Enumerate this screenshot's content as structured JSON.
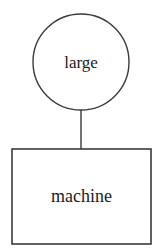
{
  "diagram": {
    "type": "node-link-diagram",
    "background_color": "#ffffff",
    "stroke_color": "#3a3a3a",
    "text_color": "#1c1c1c",
    "nodes": [
      {
        "id": "large",
        "label": "large",
        "shape": "circle",
        "center_x": 81,
        "center_y": 62,
        "radius": 48,
        "fill": "#ffffff",
        "stroke": "#3a3a3a",
        "stroke_width": 1.4,
        "font_size": 17,
        "label_baseline_y": 68
      },
      {
        "id": "machine",
        "label": "machine",
        "shape": "rectangle",
        "x": 12,
        "y": 149,
        "width": 139,
        "height": 95,
        "center_x": 81.5,
        "center_y": 196.5,
        "fill": "#ffffff",
        "stroke": "#3a3a3a",
        "stroke_width": 1.6,
        "font_size": 18,
        "label_baseline_y": 202
      }
    ],
    "edges": [
      {
        "id": "large-machine",
        "from": "large",
        "to": "machine",
        "x1": 81,
        "y1": 110,
        "x2": 81,
        "y2": 149,
        "stroke": "#3a3a3a",
        "stroke_width": 1.4
      }
    ]
  }
}
